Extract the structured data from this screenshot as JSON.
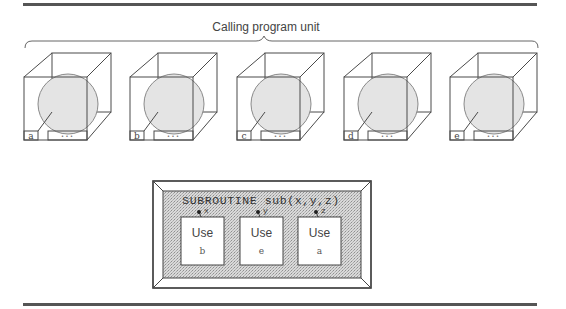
{
  "figure": {
    "top_label": "Calling program unit",
    "colors": {
      "line": "#4a4a4a",
      "rule": "#555555",
      "circle_fill": "#e4e4e4",
      "circle_stroke": "#8a8a8a",
      "stipple_bg": "#d6d6d6",
      "stipple_dot": "#9a9a9a",
      "text": "#444444"
    },
    "modules": [
      {
        "label": "a",
        "ellipsis": "• • •"
      },
      {
        "label": "b",
        "ellipsis": "• • •"
      },
      {
        "label": "c",
        "ellipsis": "• • •"
      },
      {
        "label": "d",
        "ellipsis": "• • •"
      },
      {
        "label": "e",
        "ellipsis": "• • •"
      }
    ],
    "subroutine": {
      "header": "SUBROUTINE sub(x,y,z)",
      "uses": [
        {
          "arg": "x",
          "keyword": "Use",
          "module": "b"
        },
        {
          "arg": "y",
          "keyword": "Use",
          "module": "e"
        },
        {
          "arg": "z",
          "keyword": "Use",
          "module": "a"
        }
      ]
    }
  }
}
